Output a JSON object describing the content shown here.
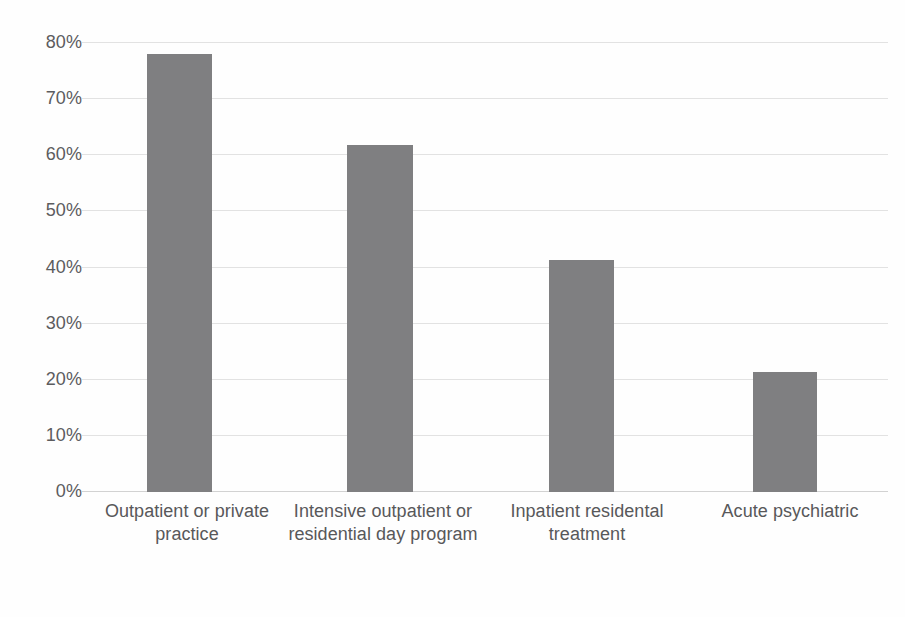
{
  "chart_data": {
    "type": "bar",
    "title": "",
    "subtitle": "",
    "xlabel": "",
    "ylabel": "",
    "categories": [
      "Outpatient or private practice",
      "Intensive outpatient or residential day program",
      "Inpatient residental treatment",
      "Acute psychiatric"
    ],
    "values": [
      78,
      61.8,
      41.3,
      21.3
    ],
    "value_labels": [
      "78%",
      "61.8%",
      "41.3%",
      "21.3%"
    ],
    "ylim": [
      0,
      80
    ],
    "ytick_labels": [
      "80%",
      "70%",
      "60%",
      "50%",
      "40%",
      "30%",
      "20%",
      "10%",
      "0%"
    ],
    "ytick_values": [
      80,
      70,
      60,
      50,
      40,
      30,
      20,
      10,
      0
    ],
    "grid": true,
    "legend": "none",
    "series": [
      {
        "name": "Percent",
        "values": [
          78,
          61.8,
          41.3,
          21.3
        ]
      }
    ],
    "colors": {
      "bar": "#7f7f81",
      "gridline": "#e2e2e2",
      "baseline": "#d2d2d2",
      "text": "#58585a",
      "background": "#ffffff"
    },
    "bar_layout": [
      {
        "left": 65,
        "width": 65
      },
      {
        "left": 265,
        "width": 66
      },
      {
        "left": 467,
        "width": 65
      },
      {
        "left": 671,
        "width": 64
      }
    ],
    "label_layout": [
      {
        "left": 0,
        "width": 210
      },
      {
        "left": 203,
        "width": 196
      },
      {
        "left": 405,
        "width": 200
      },
      {
        "left": 610,
        "width": 196
      }
    ]
  }
}
